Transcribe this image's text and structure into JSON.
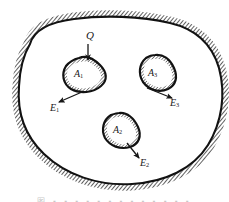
{
  "figure": {
    "kind": "engineering-diagram",
    "caption_partial": "图 ▪ ▪ ▪ ▪ ▪ ▪ ▪ ▪ ▪ ▪ ▪ ▪ ▪",
    "colors": {
      "ink": "#171717",
      "hatch": "#3a3a3a",
      "paper": "#ffffff",
      "caption": "#9a9a9a"
    },
    "labels": {
      "load": {
        "base": "Q",
        "sub": ""
      },
      "region_1": {
        "base": "A",
        "sub": "1"
      },
      "region_2": {
        "base": "A",
        "sub": "2"
      },
      "region_3": {
        "base": "A",
        "sub": "3"
      },
      "vector_1": {
        "base": "E",
        "sub": "1"
      },
      "vector_2": {
        "base": "E",
        "sub": "2"
      },
      "vector_3": {
        "base": "E",
        "sub": "3"
      }
    },
    "arrows": [
      {
        "name": "load-arrow-Q",
        "from": [
          88,
          44
        ],
        "to": [
          88,
          62
        ],
        "direction": "down"
      },
      {
        "name": "vector-arrow-E1",
        "from": [
          82,
          92
        ],
        "to": [
          57,
          103
        ],
        "direction": "down-left"
      },
      {
        "name": "vector-arrow-E3",
        "from": [
          147,
          88
        ],
        "to": [
          174,
          99
        ],
        "direction": "down-right"
      },
      {
        "name": "vector-arrow-E2",
        "from": [
          127,
          143
        ],
        "to": [
          141,
          159
        ],
        "direction": "down-right"
      }
    ]
  }
}
